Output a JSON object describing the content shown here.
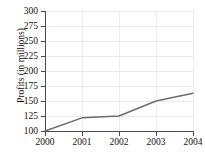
{
  "chart_data": {
    "type": "line",
    "title": "",
    "xlabel": "",
    "ylabel": "Profits (in millions)",
    "categories": [
      "2000",
      "2001",
      "2002",
      "2003",
      "2004"
    ],
    "x": [
      2000,
      2001,
      2002,
      2003,
      2004
    ],
    "values": [
      100,
      122,
      125,
      150,
      163
    ],
    "series": [
      {
        "name": "Profits",
        "values": [
          100,
          122,
          125,
          150,
          163
        ]
      }
    ],
    "xlim": [
      2000,
      2004
    ],
    "ylim": [
      100,
      300
    ],
    "y_ticks": [
      100,
      125,
      150,
      175,
      200,
      225,
      250,
      275,
      300
    ],
    "y_tick_labels": [
      "100",
      "125",
      "150",
      "175",
      "200",
      "225",
      "250",
      "275",
      "300"
    ],
    "x_ticks": [
      2000,
      2001,
      2002,
      2003,
      2004
    ],
    "x_tick_labels": [
      "2000",
      "2001",
      "2002",
      "2003",
      "2004"
    ],
    "grid": true,
    "grid_orientation": "both",
    "legend": false,
    "legend_position": "none",
    "line_color": "#6b6b6b",
    "grid_color": "#e9e9e9",
    "axis_color": "#4d4d4d",
    "background_color": "#ffffff",
    "annotations": []
  }
}
